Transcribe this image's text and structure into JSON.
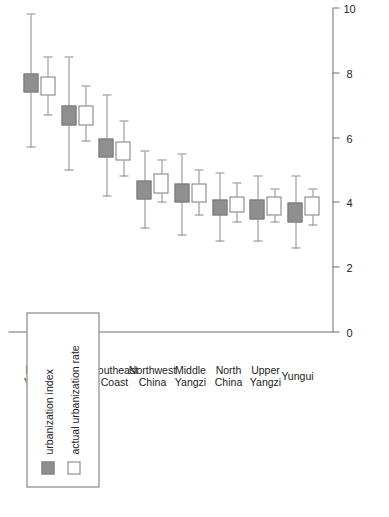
{
  "chart_data": {
    "type": "bar",
    "subtype": "grouped-box-plot-horizontal",
    "title": "",
    "subtitle": "",
    "xlabel": "",
    "ylabel": "",
    "orientation": "rotated-90-ccw",
    "grid": false,
    "legend_position": "top-left",
    "value_axis": {
      "ticks": [
        "0",
        "2",
        "4",
        "6",
        "8",
        "10"
      ],
      "tick_values": [
        0,
        2,
        4,
        6,
        8,
        10
      ],
      "range": [
        0,
        10
      ]
    },
    "categories": [
      "Lower Yangzi",
      "Lingnan",
      "Southeast Coast",
      "Northwest China",
      "Middle Yangzi",
      "North China",
      "Upper Yangzi",
      "Yungui"
    ],
    "category_lines": [
      [
        "Lower",
        "Yangzi"
      ],
      [
        "Lingnan",
        ""
      ],
      [
        "Southeast",
        "Coast"
      ],
      [
        "Northwest",
        "China"
      ],
      [
        "Middle",
        "Yangzi"
      ],
      [
        "North",
        "China"
      ],
      [
        "Upper",
        "Yangzi"
      ],
      [
        "Yungui",
        ""
      ]
    ],
    "series": [
      {
        "name": "urbanization index",
        "style": "filled",
        "color": "#8f8f8f",
        "values": [
          7.7,
          6.7,
          5.7,
          4.4,
          4.3,
          3.85,
          3.8,
          3.7
        ],
        "box_low": [
          7.4,
          6.4,
          5.4,
          4.1,
          4.0,
          3.6,
          3.5,
          3.4
        ],
        "box_high": [
          8.0,
          7.0,
          6.0,
          4.7,
          4.6,
          4.1,
          4.1,
          4.0
        ],
        "whisker_low": [
          5.7,
          5.0,
          4.2,
          3.2,
          3.0,
          2.8,
          2.8,
          2.6
        ],
        "whisker_high": [
          9.8,
          8.5,
          7.3,
          5.6,
          5.5,
          4.9,
          4.8,
          4.8
        ]
      },
      {
        "name": "actual urbanization rate",
        "style": "open",
        "color": "#ffffff",
        "values": [
          7.6,
          6.7,
          5.6,
          4.6,
          4.3,
          3.95,
          3.9,
          3.9
        ],
        "box_low": [
          7.3,
          6.4,
          5.3,
          4.3,
          4.0,
          3.7,
          3.6,
          3.6
        ],
        "box_high": [
          7.9,
          7.0,
          5.9,
          4.9,
          4.6,
          4.2,
          4.2,
          4.2
        ],
        "whisker_low": [
          6.7,
          5.9,
          4.8,
          4.0,
          3.6,
          3.4,
          3.4,
          3.3
        ],
        "whisker_high": [
          8.5,
          7.6,
          6.5,
          5.3,
          5.0,
          4.6,
          4.4,
          4.4
        ]
      }
    ]
  },
  "legend": {
    "entries": [
      {
        "label": "urbanization index",
        "style": "filled"
      },
      {
        "label": "actual urbanization rate",
        "style": "open"
      }
    ]
  }
}
